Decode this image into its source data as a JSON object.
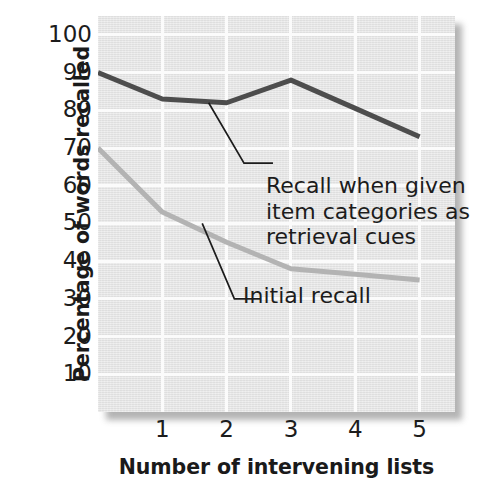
{
  "chart_data": {
    "type": "line",
    "title": "",
    "subtitle": "",
    "xlabel": "Number of intervening lists",
    "ylabel": "Percentage of words recalled",
    "x": [
      0,
      1,
      2,
      3,
      4,
      5
    ],
    "xlim": [
      0,
      5.55
    ],
    "ylim": [
      0,
      105
    ],
    "x_tick_labels": [
      "1",
      "2",
      "3",
      "4",
      "5"
    ],
    "x_tick_values": [
      1,
      2,
      3,
      4,
      5
    ],
    "y_tick_labels": [
      "100",
      "90",
      "80",
      "70",
      "60",
      "50",
      "40",
      "30",
      "20",
      "10"
    ],
    "y_tick_values": [
      100,
      90,
      80,
      70,
      60,
      50,
      40,
      30,
      20,
      10
    ],
    "grid": true,
    "grid_color": "#fbfbfb",
    "plot_background": "#e6e6e6",
    "legend_position": "inline-annotations",
    "series": [
      {
        "name": "Recall when given item categories as retrieval cues",
        "color": "#4d4d4d",
        "line_width": 5,
        "values": [
          90,
          83,
          82,
          88,
          80.5,
          73
        ]
      },
      {
        "name": "Initial recall",
        "color": "#b3b3b3",
        "line_width": 5,
        "values": [
          70,
          53,
          45,
          38,
          36.5,
          35
        ]
      }
    ],
    "annotations": [
      {
        "id": "cued-recall",
        "text": "Recall when given\nitem categories as\nretrieval cues",
        "leader_from": [
          1.72,
          82
        ],
        "leader_elbow": [
          2.27,
          66
        ],
        "leader_to": [
          2.72,
          66
        ]
      },
      {
        "id": "initial-recall",
        "text": "Initial recall",
        "leader_from": [
          1.62,
          50
        ],
        "leader_elbow": [
          2.12,
          30
        ],
        "leader_to": [
          2.52,
          30
        ]
      }
    ]
  },
  "axes": {
    "y_title": "Percentage of words recalled",
    "x_title": "Number of intervening lists"
  },
  "annotation_text": {
    "cued": "Recall when given\nitem categories as\nretrieval cues",
    "initial": "Initial recall"
  },
  "colors": {
    "dark_line": "#4d4d4d",
    "light_line": "#b3b3b3",
    "panel": "#e6e6e6",
    "grid": "#fbfbfb",
    "text": "#1c1c1c"
  }
}
